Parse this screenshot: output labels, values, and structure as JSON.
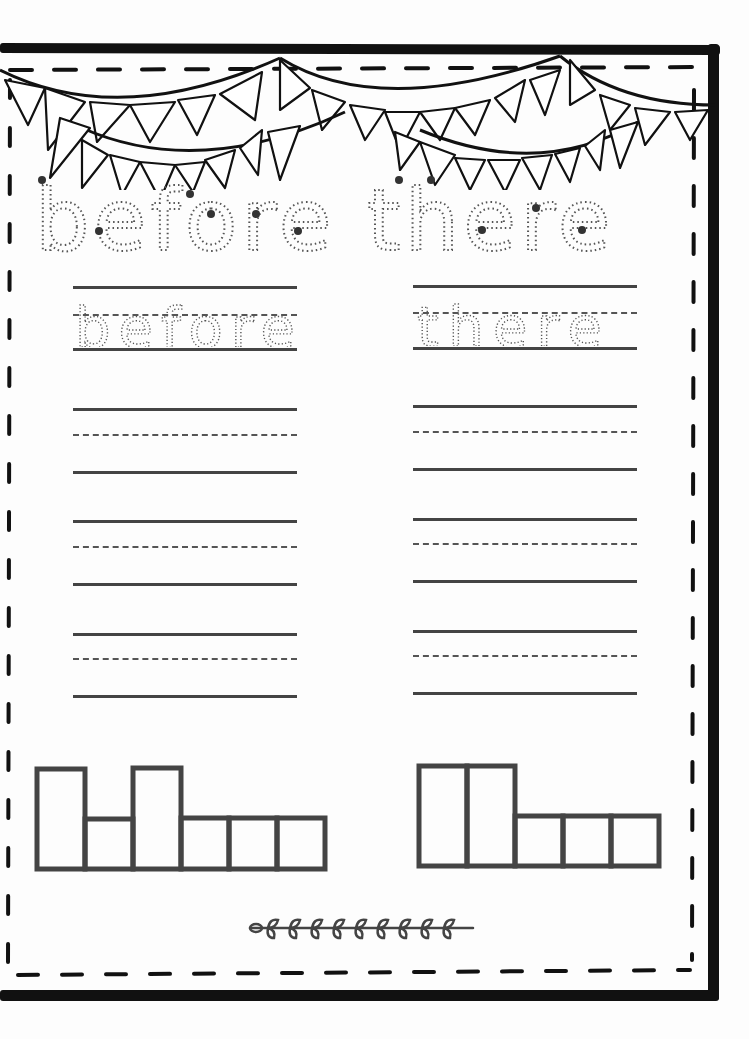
{
  "worksheet": {
    "title_words": [
      "before",
      "there"
    ],
    "trace_title": "before there",
    "columns": [
      {
        "word": "before",
        "trace_label": "before",
        "practice_rows": 3,
        "word_shape": {
          "letters": [
            "b",
            "e",
            "f",
            "o",
            "r",
            "e"
          ],
          "boxes": [
            "tall",
            "short",
            "tall",
            "short",
            "short",
            "short"
          ]
        }
      },
      {
        "word": "there",
        "trace_label": "there",
        "practice_rows": 3,
        "word_shape": {
          "letters": [
            "t",
            "h",
            "e",
            "r",
            "e"
          ],
          "boxes": [
            "tall",
            "tall",
            "short",
            "short",
            "short"
          ]
        }
      }
    ]
  },
  "decorations": {
    "bunting": "pennant-bunting-banner",
    "divider": "leaf-vine-divider",
    "border": "dashed-inner-border"
  },
  "colors": {
    "frame": "#111111",
    "lines": "#444444",
    "trace_dots": "#555555",
    "start_dots": "#333333",
    "paper": "#fdfdfd"
  }
}
